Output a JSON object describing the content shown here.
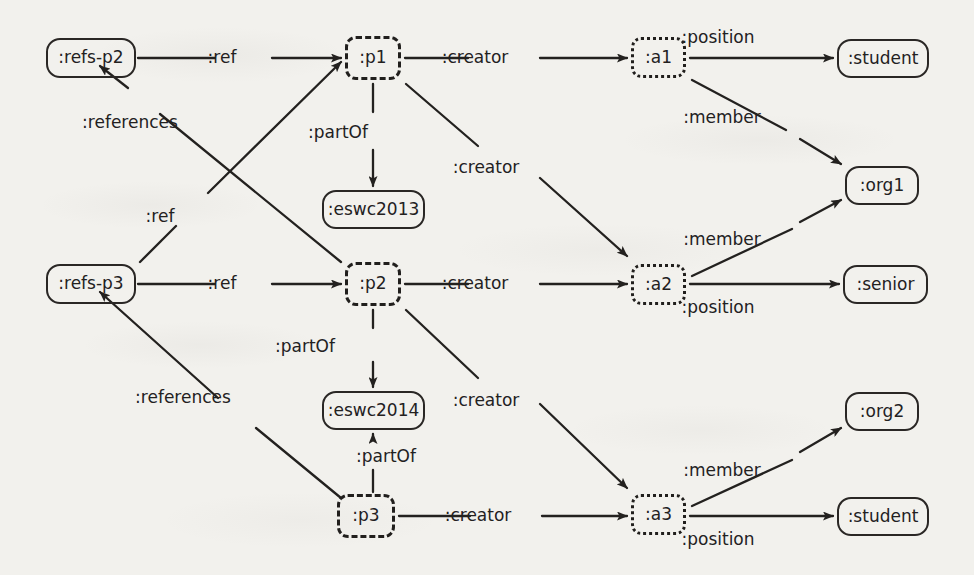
{
  "diagram": {
    "background_color": "#f2f1ed",
    "ink_color": "#23211f"
  },
  "nodes": [
    {
      "id": "refs-p2",
      "label": ":refs-p2",
      "shape": "rounded-solid",
      "x": 46,
      "y": 38,
      "w": 90,
      "h": 40
    },
    {
      "id": "p1",
      "label": ":p1",
      "shape": "rounded-dashed",
      "x": 345,
      "y": 36,
      "w": 56,
      "h": 44
    },
    {
      "id": "a1",
      "label": ":a1",
      "shape": "rounded-dotted",
      "x": 631,
      "y": 37,
      "w": 55,
      "h": 41
    },
    {
      "id": "student1",
      "label": ":student",
      "shape": "rounded-solid",
      "x": 837,
      "y": 39,
      "w": 92,
      "h": 39
    },
    {
      "id": "eswc2013",
      "label": ":eswc2013",
      "shape": "rounded-solid",
      "x": 322,
      "y": 190,
      "w": 103,
      "h": 39
    },
    {
      "id": "org1",
      "label": ":org1",
      "shape": "rounded-solid",
      "x": 845,
      "y": 166,
      "w": 74,
      "h": 39
    },
    {
      "id": "refs-p3",
      "label": ":refs-p3",
      "shape": "rounded-solid",
      "x": 46,
      "y": 264,
      "w": 90,
      "h": 40
    },
    {
      "id": "p2",
      "label": ":p2",
      "shape": "rounded-dashed",
      "x": 345,
      "y": 262,
      "w": 56,
      "h": 44
    },
    {
      "id": "a2",
      "label": ":a2",
      "shape": "rounded-dotted",
      "x": 631,
      "y": 264,
      "w": 55,
      "h": 41
    },
    {
      "id": "senior",
      "label": ":senior",
      "shape": "rounded-solid",
      "x": 843,
      "y": 265,
      "w": 85,
      "h": 39
    },
    {
      "id": "eswc2014",
      "label": ":eswc2014",
      "shape": "rounded-solid",
      "x": 322,
      "y": 391,
      "w": 103,
      "h": 39
    },
    {
      "id": "org2",
      "label": ":org2",
      "shape": "rounded-solid",
      "x": 845,
      "y": 392,
      "w": 74,
      "h": 39
    },
    {
      "id": "p3",
      "label": ":p3",
      "shape": "rounded-dashed",
      "x": 337,
      "y": 494,
      "w": 58,
      "h": 44
    },
    {
      "id": "a3",
      "label": ":a3",
      "shape": "rounded-dotted",
      "x": 631,
      "y": 494,
      "w": 55,
      "h": 41
    },
    {
      "id": "student2",
      "label": ":student",
      "shape": "rounded-solid",
      "x": 837,
      "y": 497,
      "w": 92,
      "h": 39
    }
  ],
  "edges": [
    {
      "id": "e1",
      "from": "refs-p2",
      "to": "p1",
      "label": ":ref",
      "label_x": 222,
      "label_y": 47
    },
    {
      "id": "e2",
      "from": "p1",
      "to": "a1",
      "label": ":creator",
      "label_x": 475,
      "label_y": 47
    },
    {
      "id": "e3",
      "from": "a1",
      "to": "student1",
      "label": ":position",
      "label_x": 718,
      "label_y": 27
    },
    {
      "id": "e4",
      "from": "a1",
      "to": "org1",
      "label": ":member",
      "label_x": 722,
      "label_y": 107
    },
    {
      "id": "e5",
      "from": "p1",
      "to": "eswc2013",
      "label": ":partOf",
      "label_x": 338,
      "label_y": 122
    },
    {
      "id": "e6",
      "from": "p1",
      "to": "a2",
      "label": ":creator",
      "label_x": 486,
      "label_y": 157
    },
    {
      "id": "e7",
      "from": "p2",
      "to": "refs-p2",
      "label": ":references",
      "label_x": 130,
      "label_y": 112
    },
    {
      "id": "e8",
      "from": "refs-p3",
      "to": "p1",
      "label": ":ref",
      "label_x": 160,
      "label_y": 206
    },
    {
      "id": "e9",
      "from": "refs-p3",
      "to": "p2",
      "label": ":ref",
      "label_x": 222,
      "label_y": 273
    },
    {
      "id": "e10",
      "from": "p2",
      "to": "a2",
      "label": ":creator",
      "label_x": 475,
      "label_y": 273
    },
    {
      "id": "e11",
      "from": "a2",
      "to": "org1",
      "label": ":member",
      "label_x": 722,
      "label_y": 229
    },
    {
      "id": "e12",
      "from": "a2",
      "to": "senior",
      "label": ":position",
      "label_x": 718,
      "label_y": 297
    },
    {
      "id": "e13",
      "from": "p2",
      "to": "eswc2014",
      "label": ":partOf",
      "label_x": 305,
      "label_y": 336
    },
    {
      "id": "e14",
      "from": "p2",
      "to": "a3",
      "label": ":creator",
      "label_x": 486,
      "label_y": 390
    },
    {
      "id": "e15",
      "from": "p3",
      "to": "refs-p3",
      "label": ":references",
      "label_x": 183,
      "label_y": 387
    },
    {
      "id": "e16",
      "from": "p3",
      "to": "eswc2014",
      "label": ":partOf",
      "label_x": 386,
      "label_y": 446
    },
    {
      "id": "e17",
      "from": "p3",
      "to": "a3",
      "label": ":creator",
      "label_x": 478,
      "label_y": 505
    },
    {
      "id": "e18",
      "from": "a3",
      "to": "org2",
      "label": ":member",
      "label_x": 722,
      "label_y": 460
    },
    {
      "id": "e19",
      "from": "a3",
      "to": "student2",
      "label": ":position",
      "label_x": 718,
      "label_y": 529
    }
  ],
  "edge_geometry": {
    "e1": "M 138 58 L 215 58 M 272 58 L 341 58",
    "e2": "M 405 58 L 468 58 M 540 58 L 627 58",
    "e3": "M 690 58 L 833 58",
    "e4": "M 692 80 L 786 130 M 800 139 L 841 164",
    "e5": "M 373 84 L 373 112 M 373 150 L 373 186",
    "e6": "M 406 84 L 478 146 M 540 178 L 627 256",
    "e7": "M 341 262 L 160 114 M 128 88 L 100 66",
    "e8": "M 140 262 L 176 226 M 208 193 L 341 62",
    "e9": "M 138 284 L 215 284 M 272 284 L 341 284",
    "e10": "M 405 284 L 468 284 M 540 284 L 627 284",
    "e11": "M 692 276 L 792 229 M 800 222 L 841 200",
    "e12": "M 690 284 L 839 284",
    "e13": "M 373 310 L 373 328 M 373 362 L 373 387",
    "e14": "M 406 310 L 478 378 M 540 404 L 627 488",
    "e15": "M 341 498 L 256 428 M 218 398 L 100 292",
    "e16": "M 373 492 L 373 470 M 373 440 L 373 434",
    "e17": "M 399 516 L 470 516 M 542 516 L 627 516",
    "e18": "M 692 506 L 792 460 M 800 452 L 841 428",
    "e19": "M 690 516 L 833 516"
  }
}
